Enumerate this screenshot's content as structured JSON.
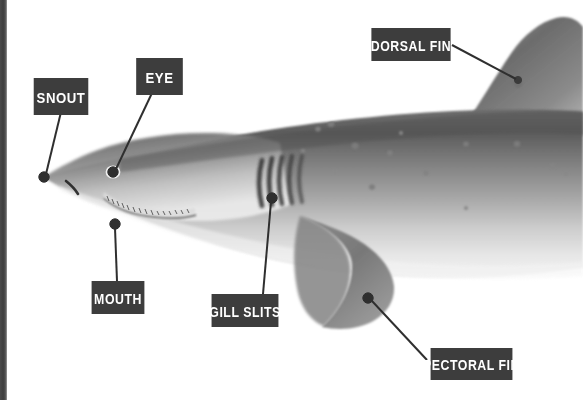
{
  "diagram": {
    "style": "grayscale illustration with labeled callout boxes",
    "background_color": "#ffffff",
    "label_box_color": "#3d3d3d",
    "label_text_color": "#ffffff",
    "leader_line_color": "#2f2f2f",
    "edge_strip_color": "#454545"
  },
  "labels": [
    {
      "id": "snout",
      "text": "SNOUT",
      "box": {
        "x": 30,
        "y": 78,
        "w": 62,
        "h": 37
      },
      "font_size": 15,
      "anchor": {
        "x": 44,
        "y": 177
      },
      "line": [
        {
          "x": 61,
          "y": 115
        },
        {
          "x": 46,
          "y": 174
        }
      ]
    },
    {
      "id": "eye",
      "text": "EYE",
      "box": {
        "x": 133,
        "y": 58,
        "w": 53,
        "h": 37
      },
      "font_size": 15,
      "anchor": {
        "x": 113,
        "y": 172
      },
      "line": [
        {
          "x": 152,
          "y": 95
        },
        {
          "x": 115,
          "y": 169
        }
      ]
    },
    {
      "id": "dorsal-fin",
      "text": "DORSAL FIN",
      "box": {
        "x": 366,
        "y": 28,
        "w": 90,
        "h": 33
      },
      "font_size": 14,
      "anchor": {
        "x": 517,
        "y": 80
      },
      "line": [
        {
          "x": 456,
          "y": 45
        },
        {
          "x": 516,
          "y": 79
        }
      ]
    },
    {
      "id": "mouth",
      "text": "MOUTH",
      "box": {
        "x": 88,
        "y": 281,
        "w": 60,
        "h": 33
      },
      "font_size": 14,
      "anchor": {
        "x": 115,
        "y": 224
      },
      "line": [
        {
          "x": 117,
          "y": 281
        },
        {
          "x": 115,
          "y": 227
        }
      ]
    },
    {
      "id": "gill-slits",
      "text": "GILL SLITS",
      "box": {
        "x": 207,
        "y": 294,
        "w": 76,
        "h": 33
      },
      "font_size": 14,
      "anchor": {
        "x": 272,
        "y": 198
      },
      "line": [
        {
          "x": 263,
          "y": 294
        },
        {
          "x": 271,
          "y": 201
        }
      ]
    },
    {
      "id": "pectoral-fin",
      "text": "PECTORAL FIN",
      "box": {
        "x": 425,
        "y": 348,
        "w": 93,
        "h": 32
      },
      "font_size": 14,
      "anchor": {
        "x": 368,
        "y": 299
      },
      "line": [
        {
          "x": 425,
          "y": 360
        },
        {
          "x": 371,
          "y": 301
        }
      ]
    }
  ],
  "shark": {
    "parts": [
      "snout",
      "eye",
      "mouth",
      "gill slits",
      "dorsal fin",
      "pectoral fin",
      "body",
      "teeth",
      "nostril"
    ],
    "gill_slit_count": 5,
    "body_top_color": "#5f5f5f",
    "body_mid_color": "#8e8e8e",
    "body_belly_color": "#e8e8e8",
    "fin_color": "#747474",
    "spot_color": "#7a7a7a",
    "spot_count": 14
  }
}
